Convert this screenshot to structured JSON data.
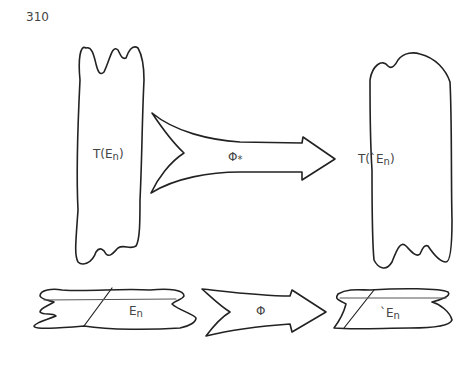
{
  "page": {
    "number": "310"
  },
  "figure": {
    "top_left_label": {
      "main": "T(E",
      "sub": "n",
      "close": ")"
    },
    "top_arrow_label": {
      "main": "Φ",
      "sub": "*"
    },
    "top_right_label": {
      "main": "T(`E",
      "sub": "n",
      "close": ")"
    },
    "bottom_left_label": {
      "main": "E",
      "sub": "n"
    },
    "bottom_arrow_label": {
      "main": "Φ"
    },
    "bottom_right_label": {
      "main": "`E",
      "sub": "n"
    }
  }
}
